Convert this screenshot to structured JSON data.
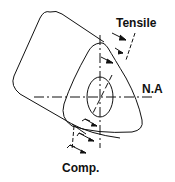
{
  "diagram": {
    "labels": {
      "tensile": "Tensile",
      "neutral_axis": "N.A",
      "compression": "Comp."
    },
    "colors": {
      "stroke": "#111111",
      "background": "#ffffff"
    }
  }
}
